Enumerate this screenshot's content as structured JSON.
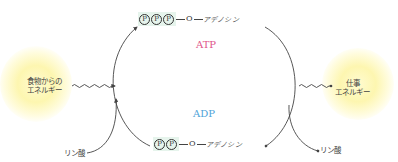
{
  "diagram": {
    "type": "ATP-ADP cycle",
    "atp": {
      "label": "ATP",
      "label_color": "#e0548a",
      "phosphates": [
        "P",
        "P",
        "P"
      ],
      "oxygen": "O",
      "base": "アデノシン"
    },
    "adp": {
      "label": "ADP",
      "label_color": "#4ea3d8",
      "phosphates": [
        "P",
        "P"
      ],
      "oxygen": "O",
      "base": "アデノシン"
    },
    "inputs": {
      "food_energy": {
        "line1": "食物からの",
        "line2": "エネルギー"
      },
      "phosphate_in": "リン酸"
    },
    "outputs": {
      "work_energy": {
        "line1": "仕事",
        "line2": "エネルギー"
      },
      "phosphate_out": "リン酸"
    },
    "colors": {
      "phosphate_highlight": "#e6f4ec",
      "energy_glow": "#fdf6b0",
      "line": "#444444"
    }
  }
}
